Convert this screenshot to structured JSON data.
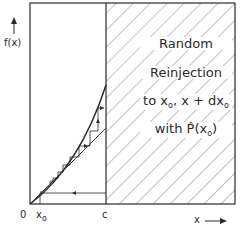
{
  "diagram": {
    "y_axis_label": "f(x)",
    "x_axis_label": "x",
    "x_arrow": "→",
    "origin_label": "0",
    "x0_label": "x",
    "x0_subscript": "o",
    "c_label": "c",
    "region_text": {
      "line1": "Random",
      "line2": "Reinjection",
      "line3_prefix": "to x",
      "line3_sub1": "o",
      "line3_mid": ", x + dx",
      "line3_sub2": "o",
      "line4_prefix": "with P̂(x",
      "line4_sub": "o",
      "line4_suffix": ")"
    },
    "colors": {
      "line": "#2a2a2a",
      "hatch": "#555555",
      "background": "#ffffff"
    }
  }
}
